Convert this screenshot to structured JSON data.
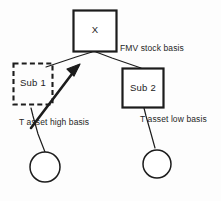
{
  "diagram": {
    "background_color": "#fdfdfd",
    "stroke_color": "#1c1c1c",
    "nodes": [
      {
        "id": "x",
        "label": "X",
        "shape": "rect",
        "border": "solid"
      },
      {
        "id": "sub1",
        "label": "Sub 1",
        "shape": "rect",
        "border": "dashed"
      },
      {
        "id": "sub2",
        "label": "Sub 2",
        "shape": "rect",
        "border": "solid"
      },
      {
        "id": "circle-left",
        "label": "",
        "shape": "circle",
        "border": "solid"
      },
      {
        "id": "circle-right",
        "label": "",
        "shape": "circle",
        "border": "solid"
      }
    ],
    "edge_labels": {
      "fmv_stock_basis": "FMV stock basis",
      "t_asset_high_basis": "T asset high basis",
      "t_asset_low_basis": "T asset low basis"
    }
  }
}
